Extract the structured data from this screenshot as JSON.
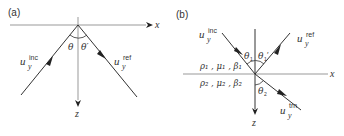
{
  "figure": {
    "panels": [
      {
        "id": "a",
        "label": "(a)",
        "axes": {
          "x_label": "x",
          "z_label": "z"
        },
        "angles": {
          "incident": "θ",
          "reflected": "θ′"
        },
        "waves": {
          "incident": {
            "symbol": "u",
            "subscript": "y",
            "superscript": "inc"
          },
          "reflected": {
            "symbol": "u",
            "subscript": "y",
            "superscript": "ref"
          }
        }
      },
      {
        "id": "b",
        "label": "(b)",
        "axes": {
          "x_label": "x",
          "z_label": "z"
        },
        "angles": {
          "incident": "θ",
          "incident_sub": "1",
          "reflected": "θ",
          "reflected_sub": "1",
          "reflected_prime": "′",
          "transmitted": "θ",
          "transmitted_sub": "2"
        },
        "waves": {
          "incident": {
            "symbol": "u",
            "subscript": "y",
            "superscript": "inc"
          },
          "reflected": {
            "symbol": "u",
            "subscript": "y",
            "superscript": "ref"
          },
          "transmitted": {
            "symbol": "u",
            "subscript": "y",
            "superscript": "trn"
          }
        },
        "media": {
          "upper": "ρ₁ , μ₁ , β₁",
          "lower": "ρ₂ , μ₂ , β₂"
        }
      }
    ]
  },
  "colors": {
    "axis": "#999999",
    "ray": "#333333",
    "text": "#333333"
  }
}
